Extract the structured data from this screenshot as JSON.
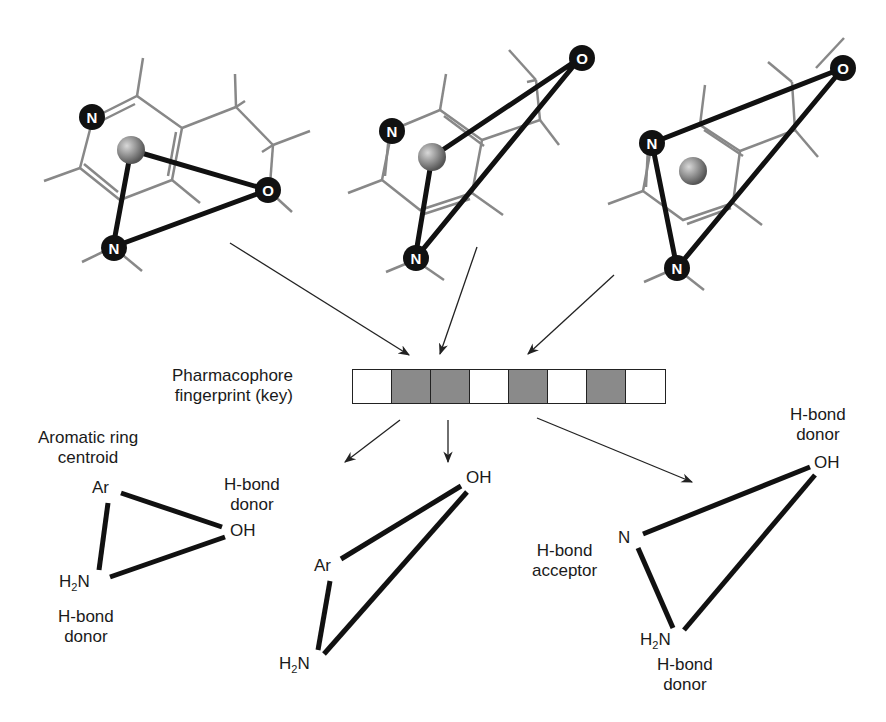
{
  "fingerprint": {
    "label_line1": "Pharmacophore",
    "label_line2": "fingerprint (key)",
    "bits": [
      0,
      1,
      1,
      0,
      1,
      0,
      1,
      0
    ],
    "on_color": "#8a8a8a",
    "off_color": "#ffffff"
  },
  "molecules": [
    {
      "atoms": [
        "N",
        "N",
        "O"
      ]
    },
    {
      "atoms": [
        "N",
        "N",
        "O"
      ]
    },
    {
      "atoms": [
        "N",
        "N",
        "O"
      ]
    }
  ],
  "pharmacophores": [
    {
      "nodes": {
        "ar": "Ar",
        "oh": "OH",
        "nh2": "H2N"
      },
      "ar_label_line1": "Aromatic ring",
      "ar_label_line2": "centroid",
      "oh_label_line1": "H-bond",
      "oh_label_line2": "donor",
      "nh2_label_line1": "H-bond",
      "nh2_label_line2": "donor"
    },
    {
      "nodes": {
        "ar": "Ar",
        "oh": "OH",
        "nh2": "H2N"
      }
    },
    {
      "nodes": {
        "n": "N",
        "oh": "OH",
        "nh2": "H2N"
      },
      "oh_label_line1": "H-bond",
      "oh_label_line2": "donor",
      "n_label_line1": "H-bond",
      "n_label_line2": "acceptor",
      "nh2_label_line1": "H-bond",
      "nh2_label_line2": "donor"
    }
  ]
}
